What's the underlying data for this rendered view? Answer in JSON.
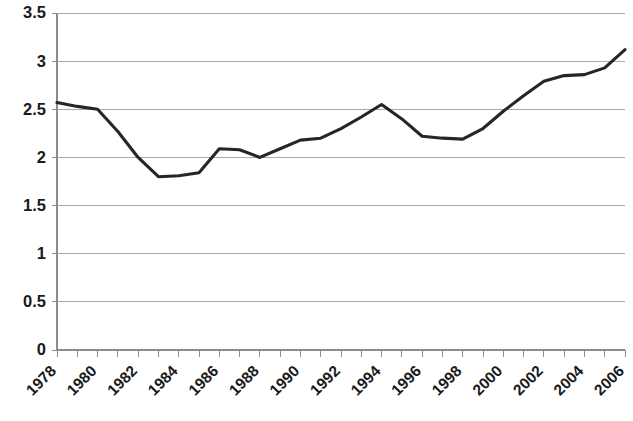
{
  "chart_data": {
    "type": "line",
    "title": "",
    "subtitle": "",
    "xlabel": "",
    "ylabel": "",
    "grid": true,
    "legend": false,
    "legend_position": "none",
    "line_color": "#262626",
    "gridline_color": "#a9a9a9",
    "axis_color": "#8c8c8c",
    "text_color": "#1a1a1a",
    "xlim": [
      1978,
      2006
    ],
    "ylim": [
      0,
      3.5
    ],
    "y_tick_step": 0.5,
    "x_tick_step": 1,
    "x_label_step": 2,
    "x_label_rotation": -45,
    "ytick_labels": [
      "0",
      "0.5",
      "1",
      "1.5",
      "2",
      "2.5",
      "3",
      "3.5"
    ],
    "ytick_values": [
      0,
      0.5,
      1,
      1.5,
      2,
      2.5,
      3,
      3.5
    ],
    "xtick_labels": [
      "1978",
      "1980",
      "1982",
      "1984",
      "1986",
      "1988",
      "1990",
      "1992",
      "1994",
      "1996",
      "1998",
      "2000",
      "2002",
      "2004",
      "2006"
    ],
    "xtick_values": [
      1978,
      1980,
      1982,
      1984,
      1986,
      1988,
      1990,
      1992,
      1994,
      1996,
      1998,
      2000,
      2002,
      2004,
      2006
    ],
    "x": [
      1978,
      1979,
      1980,
      1981,
      1982,
      1983,
      1984,
      1985,
      1986,
      1987,
      1988,
      1989,
      1990,
      1991,
      1992,
      1993,
      1994,
      1995,
      1996,
      1997,
      1998,
      1999,
      2000,
      2001,
      2002,
      2003,
      2004,
      2005,
      2006
    ],
    "values": [
      2.57,
      2.53,
      2.5,
      2.27,
      2.0,
      1.8,
      1.81,
      1.84,
      2.09,
      2.08,
      2.0,
      2.09,
      2.18,
      2.2,
      2.3,
      2.42,
      2.55,
      2.4,
      2.22,
      2.2,
      2.19,
      2.3,
      2.48,
      2.64,
      2.79,
      2.85,
      2.86,
      2.93,
      3.12
    ],
    "series": [
      {
        "name": "series-1",
        "values": [
          2.57,
          2.53,
          2.5,
          2.27,
          2.0,
          1.8,
          1.81,
          1.84,
          2.09,
          2.08,
          2.0,
          2.09,
          2.18,
          2.2,
          2.3,
          2.42,
          2.55,
          2.4,
          2.22,
          2.2,
          2.19,
          2.3,
          2.48,
          2.64,
          2.79,
          2.85,
          2.86,
          2.93,
          3.12
        ]
      }
    ]
  }
}
